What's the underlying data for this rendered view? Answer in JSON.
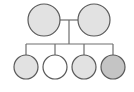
{
  "diagram": {
    "type": "pedigree",
    "colors": {
      "line": "#6e6e6e",
      "stroke": "#5a5a5a",
      "light": "#e2e2e2",
      "white": "#ffffff",
      "dark": "#c4c4c4"
    },
    "parents": [
      {
        "id": "parent-1",
        "cx": 44,
        "cy": 20,
        "r": 16,
        "fill": "#e2e2e2"
      },
      {
        "id": "parent-2",
        "cx": 94,
        "cy": 20,
        "r": 16,
        "fill": "#e2e2e2"
      }
    ],
    "children": [
      {
        "id": "child-1",
        "cx": 26,
        "cy": 67,
        "r": 12,
        "fill": "#e2e2e2"
      },
      {
        "id": "child-2",
        "cx": 55,
        "cy": 67,
        "r": 12,
        "fill": "#ffffff"
      },
      {
        "id": "child-3",
        "cx": 84,
        "cy": 67,
        "r": 12,
        "fill": "#e2e2e2"
      },
      {
        "id": "child-4",
        "cx": 113,
        "cy": 67,
        "r": 12,
        "fill": "#c4c4c4"
      }
    ]
  }
}
